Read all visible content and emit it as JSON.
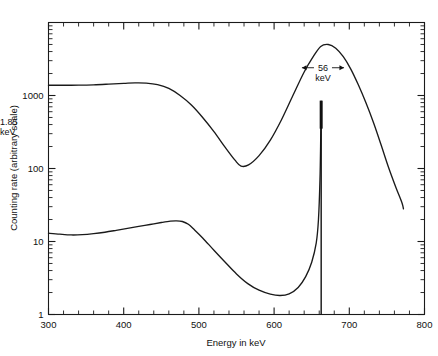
{
  "chart_data": {
    "type": "line",
    "title": "",
    "xlabel": "Energy in keV",
    "ylabel": "Counting rate (arbitrary scale)",
    "xlim": [
      300,
      800
    ],
    "ylim": [
      1,
      10000
    ],
    "yscale": "log",
    "xscale": "linear",
    "grid": false,
    "legend": "none",
    "x_major_ticks": [
      300,
      400,
      500,
      600,
      700,
      800
    ],
    "x_tick_labels": [
      "300",
      "400",
      "500",
      "600",
      "700",
      "800"
    ],
    "x_minor_tick_step": 20,
    "y_major_ticks": [
      1,
      10,
      100,
      1000
    ],
    "y_tick_labels": [
      "1",
      "10",
      "100",
      "1000"
    ],
    "y_minor_decades": [
      2,
      3,
      4,
      5,
      6,
      7,
      8,
      9
    ],
    "series": [
      {
        "name": "scintillation-detector-spectrum",
        "description": "broad low-resolution peak, 56 keV FWHM",
        "points": [
          [
            300,
            1380
          ],
          [
            320,
            1380
          ],
          [
            340,
            1385
          ],
          [
            360,
            1400
          ],
          [
            380,
            1430
          ],
          [
            400,
            1465
          ],
          [
            415,
            1490
          ],
          [
            430,
            1480
          ],
          [
            445,
            1410
          ],
          [
            460,
            1250
          ],
          [
            475,
            1000
          ],
          [
            490,
            740
          ],
          [
            505,
            500
          ],
          [
            520,
            320
          ],
          [
            535,
            195
          ],
          [
            548,
            130
          ],
          [
            556,
            108
          ],
          [
            566,
            112
          ],
          [
            580,
            150
          ],
          [
            595,
            245
          ],
          [
            610,
            470
          ],
          [
            625,
            1000
          ],
          [
            640,
            2100
          ],
          [
            652,
            3400
          ],
          [
            662,
            4700
          ],
          [
            672,
            5000
          ],
          [
            682,
            4450
          ],
          [
            692,
            3400
          ],
          [
            702,
            2300
          ],
          [
            712,
            1400
          ],
          [
            722,
            800
          ],
          [
            732,
            430
          ],
          [
            742,
            215
          ],
          [
            752,
            105
          ],
          [
            762,
            55
          ],
          [
            770,
            34
          ],
          [
            772,
            28
          ]
        ]
      },
      {
        "name": "semiconductor-detector-spectrum",
        "description": "low background with sharp 1.85 keV FWHM line",
        "points": [
          [
            300,
            13.0
          ],
          [
            315,
            12.6
          ],
          [
            330,
            12.3
          ],
          [
            345,
            12.4
          ],
          [
            360,
            12.8
          ],
          [
            375,
            13.4
          ],
          [
            390,
            14.2
          ],
          [
            405,
            15.1
          ],
          [
            420,
            16.1
          ],
          [
            435,
            17.1
          ],
          [
            450,
            18.2
          ],
          [
            462,
            19.0
          ],
          [
            470,
            19.2
          ],
          [
            478,
            18.8
          ],
          [
            486,
            17.2
          ],
          [
            494,
            14.5
          ],
          [
            505,
            11.2
          ],
          [
            520,
            7.6
          ],
          [
            535,
            5.2
          ],
          [
            550,
            3.6
          ],
          [
            565,
            2.65
          ],
          [
            580,
            2.15
          ],
          [
            595,
            1.9
          ],
          [
            608,
            1.82
          ],
          [
            620,
            1.92
          ],
          [
            632,
            2.35
          ],
          [
            642,
            3.3
          ],
          [
            650,
            5.2
          ],
          [
            656,
            9.5
          ],
          [
            659,
            20
          ],
          [
            661,
            70
          ],
          [
            662,
            260
          ],
          [
            662.6,
            800
          ]
        ]
      }
    ],
    "annotations": [
      {
        "id": "broad-peak-width",
        "value": "56",
        "unit": "keV",
        "label_line1": "56",
        "label_line2": "keV",
        "x_center": 665,
        "x_left": 637,
        "x_right": 693,
        "y": 2400
      },
      {
        "id": "narrow-peak-width",
        "value": "1.85",
        "unit": "keV",
        "label_line1": "1.85",
        "label_line2": "keV",
        "x_center": 662.6,
        "y": 430
      }
    ],
    "spike": {
      "name": "sharp-photopeak",
      "x": 662.6,
      "y_top": 850,
      "y_bottom": 1,
      "fwhm_kev": 1.85
    }
  },
  "axes": {
    "x_title": "Energy in keV",
    "y_title": "Counting rate (arbitrary scale)"
  }
}
